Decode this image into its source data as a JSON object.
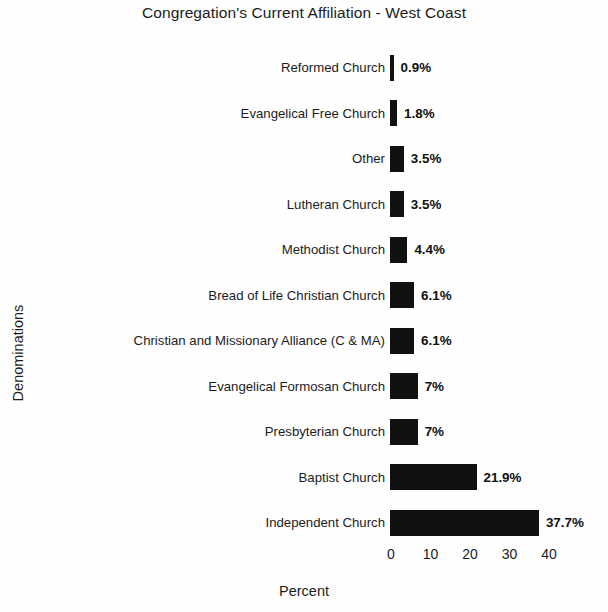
{
  "chart_data": {
    "type": "bar",
    "orientation": "horizontal",
    "title": "Congregation's Current Affiliation - West Coast",
    "xlabel": "Percent",
    "ylabel": "Denominations",
    "xlim": [
      0,
      40
    ],
    "xticks": [
      0,
      10,
      20,
      30,
      40
    ],
    "xtick_labels": [
      "0",
      "10",
      "20",
      "30",
      "40"
    ],
    "grid": false,
    "legend": null,
    "bar_color": "#111111",
    "categories": [
      "Reformed Church",
      "Evangelical Free Church",
      "Other",
      "Lutheran Church",
      "Methodist Church",
      "Bread of Life Christian Church",
      "Christian and Missionary Alliance (C & MA)",
      "Evangelical Formosan Church",
      "Presbyterian Church",
      "Baptist Church",
      "Independent Church"
    ],
    "values": [
      0.9,
      1.8,
      3.5,
      3.5,
      4.4,
      6.1,
      6.1,
      7,
      7,
      21.9,
      37.7
    ],
    "data_labels": [
      "0.9%",
      "1.8%",
      "3.5%",
      "3.5%",
      "4.4%",
      "6.1%",
      "6.1%",
      "7%",
      "7%",
      "21.9%",
      "37.7%"
    ]
  }
}
